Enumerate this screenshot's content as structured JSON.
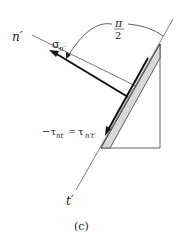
{
  "figure": {
    "caption": "(c)",
    "axes": {
      "n_axis_label": "n′",
      "t_axis_label": "t′"
    },
    "normal_stress": {
      "symbol": "σ",
      "subscript": "n′"
    },
    "angle": {
      "numerator": "π",
      "denominator": "2"
    },
    "shear_stress": {
      "lhs": "−τ",
      "lhs_subscript": "nt",
      "equals": "=",
      "rhs": "τ",
      "rhs_subscript": "n′t′"
    },
    "colors": {
      "line": "#222222",
      "plane_fill": "#d9d9d9"
    }
  }
}
